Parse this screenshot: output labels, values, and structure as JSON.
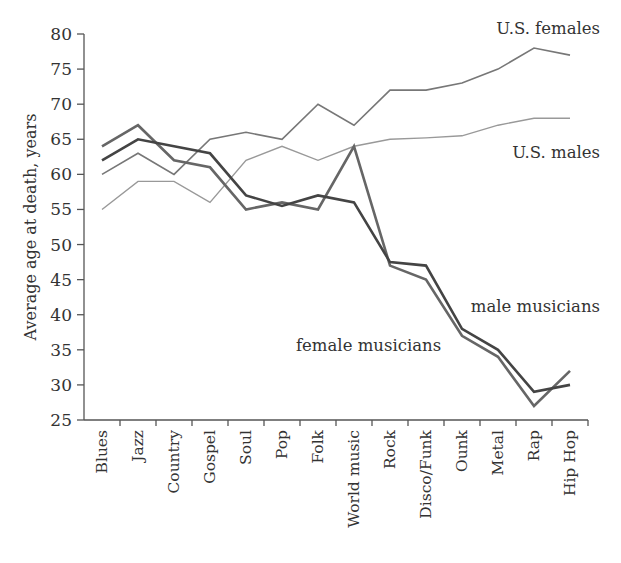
{
  "chart_data": {
    "type": "line",
    "title": "",
    "xlabel": "",
    "ylabel": "Average age at death, years",
    "ylim": [
      25,
      80
    ],
    "yticks": [
      25,
      30,
      35,
      40,
      45,
      50,
      55,
      60,
      65,
      70,
      75,
      80
    ],
    "grid": false,
    "legend": "inline labels",
    "categories": [
      "Blues",
      "Jazz",
      "Country",
      "Gospel",
      "Soul",
      "Pop",
      "Folk",
      "World music",
      "Rock",
      "Disco/Funk",
      "Ounk",
      "Metal",
      "Rap",
      "Hip Hop"
    ],
    "series": [
      {
        "name": "U.S. females",
        "color": "#777777",
        "width": 1.6,
        "values": [
          60,
          63,
          60,
          65,
          66,
          65,
          70,
          67,
          72,
          72,
          73,
          75,
          78,
          77
        ]
      },
      {
        "name": "U.S. males",
        "color": "#999999",
        "width": 1.4,
        "values": [
          55,
          59,
          59,
          56,
          62,
          64,
          62,
          64,
          65,
          65.2,
          65.5,
          67,
          68,
          68
        ]
      },
      {
        "name": "female musicians",
        "color": "#666666",
        "width": 2.6,
        "values": [
          64,
          67,
          62,
          61,
          55,
          56,
          55,
          64,
          47,
          45,
          37,
          34,
          27,
          32
        ]
      },
      {
        "name": "male musicians",
        "color": "#444444",
        "width": 2.6,
        "values": [
          62,
          65,
          64,
          63,
          57,
          55.5,
          57,
          56,
          47.5,
          47,
          38,
          35,
          29,
          30
        ]
      }
    ],
    "annotations": [
      {
        "text": "U.S. females",
        "x": 600,
        "y": 34,
        "anchor": "end"
      },
      {
        "text": "U.S. males",
        "x": 600,
        "y": 158,
        "anchor": "end"
      },
      {
        "text": "male musicians",
        "x": 600,
        "y": 312,
        "anchor": "end"
      },
      {
        "text": "female musicians",
        "x": 296,
        "y": 351,
        "anchor": "start"
      }
    ]
  }
}
